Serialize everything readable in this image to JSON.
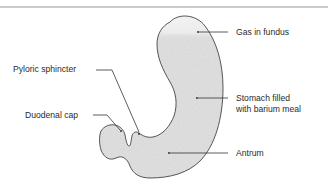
{
  "figure": {
    "colors": {
      "fill": "#d9d9d9",
      "outline": "#444444",
      "gas": "#efefef",
      "text": "#2a2a2a",
      "rule": "#8a8a8a"
    },
    "labels": {
      "gas_in_fundus": "Gas in fundus",
      "pyloric_sphincter": "Pyloric sphincter",
      "stomach_line1": "Stomach filled",
      "stomach_line2": "with barium meal",
      "duodenal_cap": "Duodenal cap",
      "antrum": "Antrum"
    }
  }
}
